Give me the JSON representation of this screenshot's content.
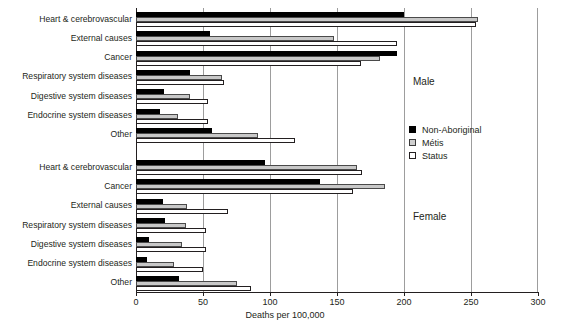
{
  "chart_data": {
    "type": "bar",
    "orientation": "horizontal",
    "title": "",
    "xlabel": "Deaths per 100,000",
    "ylabel": "",
    "xlim": [
      0,
      300
    ],
    "xticks": [
      0,
      50,
      100,
      150,
      200,
      250,
      300
    ],
    "grid": true,
    "legend_position": "right-middle",
    "legend": [
      "Non-Aboriginal",
      "Métis",
      "Status"
    ],
    "series": [
      {
        "name": "Non-Aboriginal",
        "color": "#000000"
      },
      {
        "name": "Métis",
        "color": "#c8c8c8"
      },
      {
        "name": "Status",
        "color": "#ffffff"
      }
    ],
    "panels": [
      {
        "name": "Male",
        "categories": [
          "Heart & cerebrovascular",
          "External causes",
          "Cancer",
          "Respiratory system diseases",
          "Digestive system diseases",
          "Endocrine system diseases",
          "Other"
        ],
        "values": {
          "Non-Aboriginal": [
            200,
            55,
            195,
            40,
            21,
            18,
            57
          ],
          "Métis": [
            255,
            148,
            182,
            64,
            40,
            31,
            91
          ],
          "Status": [
            254,
            195,
            168,
            66,
            54,
            54,
            119
          ]
        }
      },
      {
        "name": "Female",
        "categories": [
          "Heart & cerebrovascular",
          "Cancer",
          "External causes",
          "Respiratory system diseases",
          "Digestive system diseases",
          "Endocrine system diseases",
          "Other"
        ],
        "values": {
          "Non-Aboriginal": [
            96,
            137,
            20,
            22,
            10,
            8,
            32
          ],
          "Métis": [
            165,
            186,
            38,
            37,
            34,
            28,
            75
          ],
          "Status": [
            169,
            162,
            69,
            52,
            52,
            50,
            86
          ]
        }
      }
    ]
  },
  "annotations": {
    "male": "Male",
    "female": "Female"
  },
  "legend": {
    "items": [
      {
        "label": "Non-Aboriginal",
        "swatch": "filled-black"
      },
      {
        "label": "Métis",
        "swatch": "light-gray"
      },
      {
        "label": "Status",
        "swatch": "white-outline"
      }
    ]
  },
  "axis": {
    "x_title": "Deaths per 100,000",
    "x_tick_labels": [
      "0",
      "50",
      "100",
      "150",
      "200",
      "250",
      "300"
    ]
  }
}
